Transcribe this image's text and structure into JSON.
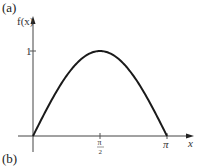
{
  "panel_labels": {
    "top": "(a)",
    "bottom": "(b)"
  },
  "chart_data": {
    "type": "line",
    "title": "",
    "xlabel": "x",
    "ylabel": "f(x)",
    "function": "sin(x)",
    "xlim": [
      0,
      3.2
    ],
    "ylim": [
      0,
      1.2
    ],
    "x_ticks": [
      {
        "value": 1.5708,
        "label_num": "π",
        "label_den": "2"
      },
      {
        "value": 3.1416,
        "label": "π"
      }
    ],
    "y_ticks": [
      {
        "value": 1,
        "label": "1"
      }
    ],
    "grid": false,
    "series": [
      {
        "name": "f(x)",
        "x": [
          0,
          0.3927,
          0.7854,
          1.1781,
          1.5708,
          1.9635,
          2.3562,
          2.7489,
          3.1416
        ],
        "y": [
          0,
          0.383,
          0.707,
          0.924,
          1,
          0.924,
          0.707,
          0.383,
          0
        ]
      }
    ]
  }
}
